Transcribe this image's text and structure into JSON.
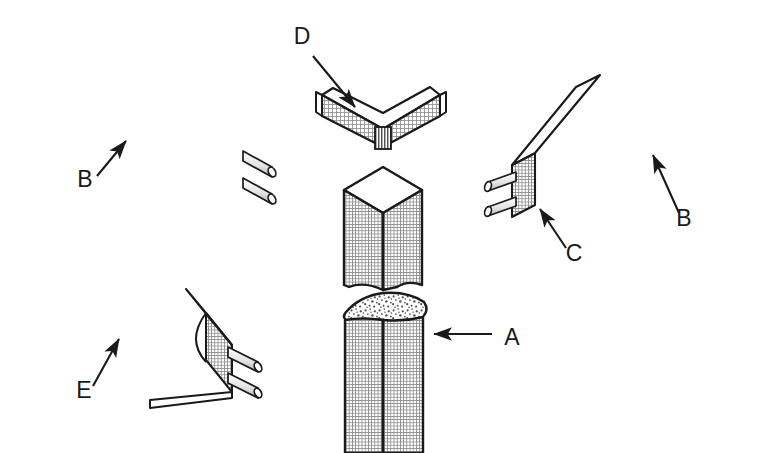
{
  "figure": {
    "background_color": "#ffffff",
    "line_color": "#1a1a1a",
    "texture_color": "#8a8a8a",
    "fracture_color": "#6e6e6e",
    "width": 771,
    "height": 453
  },
  "callouts": [
    {
      "id": "callout-a",
      "label": "A",
      "label_x": 503,
      "label_y": 345,
      "target": "fracture-face-of-lower-square-bar",
      "leader": "horizontal-line-with-left-arrowhead",
      "arrow_tip_x": 432,
      "arrow_tip_y": 334
    },
    {
      "id": "callout-b-left",
      "label": "B",
      "label_x": 85,
      "label_y": 187,
      "target": "front-face-of-upper-left-rectangular-bar",
      "leader": "diagonal-line-with-up-right-arrowhead",
      "arrow_tip_x": 128,
      "arrow_tip_y": 139
    },
    {
      "id": "callout-b-right",
      "label": "B",
      "label_x": 684,
      "label_y": 226,
      "target": "front-face-of-right-rectangular-bar",
      "leader": "diagonal-line-with-up-right-arrowhead",
      "arrow_tip_x": 651,
      "arrow_tip_y": 153
    },
    {
      "id": "callout-c",
      "label": "C",
      "label_x": 574,
      "label_y": 261,
      "target": "end-face-with-lead-wires-of-right-bar",
      "leader": "diagonal-line-with-up-left-arrowhead",
      "arrow_tip_x": 538,
      "arrow_tip_y": 207
    },
    {
      "id": "callout-d",
      "label": "D",
      "label_x": 302,
      "label_y": 44,
      "target": "top-surface-of-v-bent-strip",
      "leader": "diagonal-line-with-down-right-arrowhead",
      "arrow_tip_x": 357,
      "arrow_tip_y": 109
    },
    {
      "id": "callout-e",
      "label": "E",
      "label_x": 84,
      "label_y": 398,
      "target": "grooved-face-of-lower-left-channel-bar",
      "leader": "diagonal-line-with-up-right-arrowhead",
      "arrow_tip_x": 121,
      "arrow_tip_y": 337
    }
  ],
  "parts": [
    {
      "id": "upper-left-bar",
      "name": "upper-left-rectangular-bar",
      "description": "Long rectangular extruded bar in oblique view, cross-hatched texture, two cylindrical lead wires at the lower-right end face",
      "lead_count": 2
    },
    {
      "id": "lower-left-channel-bar",
      "name": "lower-left-grooved-channel-bar",
      "description": "Long bar with concave longitudinal groove on top and rounded bottom edge, two cylindrical lead wires at the lower-right end face",
      "lead_count": 2
    },
    {
      "id": "v-bent-strip",
      "name": "v-bent-strip",
      "description": "Chevron / V-shaped bent flat strip with white top surface and hatched seam line at the bend apex",
      "lead_count": 0
    },
    {
      "id": "upper-square-bar",
      "name": "upper-square-bar-segment",
      "description": "Upper half of a vertical square bar shown isometrically with white top face and torn lower end",
      "lead_count": 0
    },
    {
      "id": "lower-square-bar",
      "name": "lower-square-bar-segment",
      "description": "Lower half of the vertical square bar with a coarse granular fracture surface at its top, running off the bottom of the frame",
      "lead_count": 0
    },
    {
      "id": "right-bar",
      "name": "right-rectangular-bar",
      "description": "Long rectangular extruded bar mirrored in oblique view, two cylindrical lead wires at the lower-left end face",
      "lead_count": 2
    }
  ]
}
